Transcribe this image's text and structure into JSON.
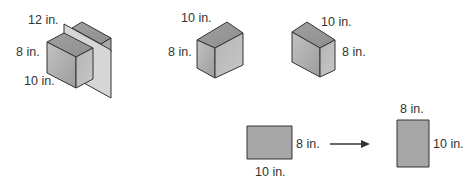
{
  "figures": {
    "cube_with_plane": {
      "length_label": "12 in.",
      "height_label": "8 in.",
      "width_label": "10 in."
    },
    "cube_view_a": {
      "top_label": "10 in.",
      "side_label": "8 in."
    },
    "cube_view_b": {
      "top_label": "10 in.",
      "side_label": "8 in."
    },
    "rectangle_before": {
      "side_label": "8 in.",
      "bottom_label": "10 in."
    },
    "rectangle_after": {
      "top_label": "8 in.",
      "side_label": "10 in."
    }
  },
  "colors": {
    "face_front": "#a8a8a8",
    "face_side": "#b8b8b8",
    "face_top": "#9a9a9a",
    "plane": "#d4d4d4",
    "rect_fill": "#a6a6a6",
    "stroke": "#333333"
  }
}
